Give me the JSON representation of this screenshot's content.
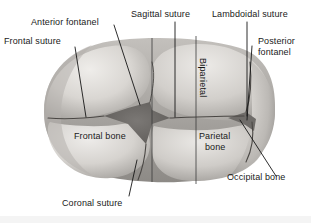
{
  "figure": {
    "background_color": "#ffffff",
    "ink_color": "#1a1a1a"
  },
  "labels": {
    "anterior_fontanel": "Anterior fontanel",
    "frontal_suture": "Frontal suture",
    "sagittal_suture": "Sagittal suture",
    "lambdoidal_suture": "Lambdoidal suture",
    "posterior_fontanel_line1": "Posterior",
    "posterior_fontanel_line2": "fontanel",
    "biparietal": "Biparietal",
    "frontal_bone": "Frontal bone",
    "parietal_bone_line1": "Parietal",
    "parietal_bone_line2": "bone",
    "occipital_bone": "Occipital bone",
    "coronal_suture": "Coronal suture"
  },
  "colors": {
    "bone_light": "#e8e6e3",
    "bone_mid": "#c9c6c2",
    "bone_shadow": "#9e9b97",
    "fontanel_dark": "#6e6b68",
    "suture_line": "#4a4744",
    "leader_line": "#161616"
  }
}
